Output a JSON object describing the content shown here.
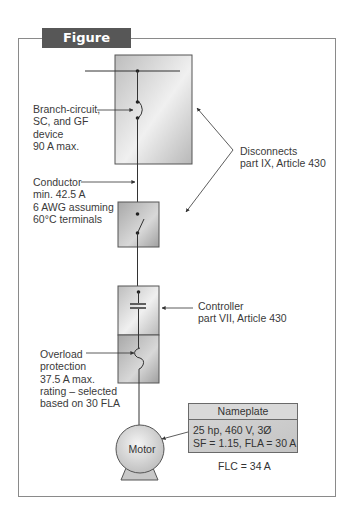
{
  "figure": {
    "title": "Figure 4.10(c)",
    "colors": {
      "title_tab_bg": "#575757",
      "title_tab_text": "#ffffff",
      "frame_border": "#8a8a8a",
      "box_fill": "#cfcfcf",
      "line": "#3a3a3a"
    }
  },
  "labels": {
    "branch_circuit": "Branch-circuit,\nSC, and GF\ndevice\n90 A max.",
    "disconnects": "Disconnects\npart IX, Article 430",
    "conductor": "Conductor\nmin. 42.5 A\n6 AWG assuming\n60°C terminals",
    "controller": "Controller\npart VII, Article 430",
    "overload": "Overload\nprotection\n37.5 A max.\nrating – selected\nbased on 30 FLA"
  },
  "motor": {
    "label": "Motor"
  },
  "nameplate": {
    "header": "Nameplate",
    "line1": "25 hp, 460 V, 3Ø",
    "line2": "SF = 1.15, FLA = 30 A"
  },
  "flc": "FLC = 34 A",
  "components": [
    {
      "name": "branch-circuit device (breaker)",
      "symbol": "circuit-breaker"
    },
    {
      "name": "disconnect switch",
      "symbol": "switch"
    },
    {
      "name": "controller",
      "symbol": "contact"
    },
    {
      "name": "overload protection",
      "symbol": "overload-heater"
    },
    {
      "name": "motor",
      "symbol": "motor"
    }
  ]
}
